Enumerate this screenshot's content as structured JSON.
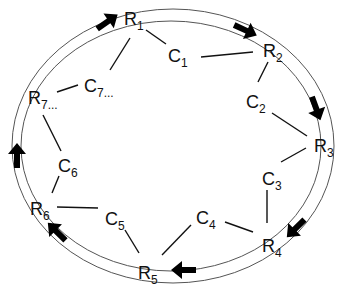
{
  "diagram": {
    "type": "ring",
    "ring": {
      "outer": {
        "cx": 173,
        "cy": 146,
        "rx": 161,
        "ry": 137
      },
      "inner": {
        "cx": 171,
        "cy": 146,
        "rx": 150,
        "ry": 125
      }
    },
    "colors": {
      "ring": "#555555",
      "link": "#111111",
      "arrow": "#000000",
      "text": "#111111"
    },
    "r_nodes": [
      {
        "id": "R1",
        "base": "R",
        "sub": "1",
        "suffix": "",
        "x": 124,
        "y": 25
      },
      {
        "id": "R2",
        "base": "R",
        "sub": "2",
        "suffix": "",
        "x": 263,
        "y": 57
      },
      {
        "id": "R3",
        "base": "R",
        "sub": "3",
        "suffix": "",
        "x": 314,
        "y": 152
      },
      {
        "id": "R4",
        "base": "R",
        "sub": "4",
        "suffix": "",
        "x": 262,
        "y": 252
      },
      {
        "id": "R5",
        "base": "R",
        "sub": "5",
        "suffix": "",
        "x": 138,
        "y": 279
      },
      {
        "id": "R6",
        "base": "R",
        "sub": "6",
        "suffix": "",
        "x": 30,
        "y": 215
      },
      {
        "id": "R7",
        "base": "R",
        "sub": "7",
        "suffix": "...",
        "x": 28,
        "y": 104
      }
    ],
    "c_nodes": [
      {
        "id": "C1",
        "base": "C",
        "sub": "1",
        "suffix": "",
        "x": 168,
        "y": 62
      },
      {
        "id": "C2",
        "base": "C",
        "sub": "2",
        "suffix": "",
        "x": 246,
        "y": 108
      },
      {
        "id": "C3",
        "base": "C",
        "sub": "3",
        "suffix": "",
        "x": 262,
        "y": 185
      },
      {
        "id": "C4",
        "base": "C",
        "sub": "4",
        "suffix": "",
        "x": 196,
        "y": 224
      },
      {
        "id": "C5",
        "base": "C",
        "sub": "5",
        "suffix": "",
        "x": 105,
        "y": 225
      },
      {
        "id": "C6",
        "base": "C",
        "sub": "6",
        "suffix": "",
        "x": 58,
        "y": 172
      },
      {
        "id": "C7",
        "base": "C",
        "sub": "7",
        "suffix": "...",
        "x": 84,
        "y": 92
      }
    ],
    "links": [
      {
        "from": "R1",
        "to": "C1",
        "x1": 146,
        "y1": 30,
        "x2": 166,
        "y2": 44
      },
      {
        "from": "C1",
        "to": "R2",
        "x1": 201,
        "y1": 57,
        "x2": 253,
        "y2": 52
      },
      {
        "from": "R2",
        "to": "C2",
        "x1": 268,
        "y1": 62,
        "x2": 258,
        "y2": 82
      },
      {
        "from": "C2",
        "to": "R3",
        "x1": 272,
        "y1": 113,
        "x2": 307,
        "y2": 136
      },
      {
        "from": "R3",
        "to": "C3",
        "x1": 306,
        "y1": 148,
        "x2": 281,
        "y2": 162
      },
      {
        "from": "C3",
        "to": "R4",
        "x1": 267,
        "y1": 190,
        "x2": 267,
        "y2": 223
      },
      {
        "from": "R4",
        "to": "C4",
        "x1": 253,
        "y1": 232,
        "x2": 225,
        "y2": 222
      },
      {
        "from": "C4",
        "to": "R5",
        "x1": 191,
        "y1": 225,
        "x2": 162,
        "y2": 255
      },
      {
        "from": "R5",
        "to": "C5",
        "x1": 139,
        "y1": 253,
        "x2": 125,
        "y2": 230
      },
      {
        "from": "C5",
        "to": "R6",
        "x1": 98,
        "y1": 208,
        "x2": 57,
        "y2": 207
      },
      {
        "from": "R6",
        "to": "C6",
        "x1": 52,
        "y1": 193,
        "x2": 59,
        "y2": 176
      },
      {
        "from": "C6",
        "to": "R7",
        "x1": 61,
        "y1": 151,
        "x2": 43,
        "y2": 115
      },
      {
        "from": "R7",
        "to": "C7",
        "x1": 57,
        "y1": 92,
        "x2": 78,
        "y2": 85
      },
      {
        "from": "C7",
        "to": "R1",
        "x1": 110,
        "y1": 70,
        "x2": 130,
        "y2": 38
      }
    ],
    "arrows": [
      {
        "name": "arrow-near-R1",
        "x": 107,
        "y": 22,
        "angle": -35
      },
      {
        "name": "arrow-near-R2",
        "x": 245,
        "y": 30,
        "angle": 25
      },
      {
        "name": "arrow-near-R3",
        "x": 316,
        "y": 108,
        "angle": 70
      },
      {
        "name": "arrow-near-R4",
        "x": 296,
        "y": 228,
        "angle": 135
      },
      {
        "name": "arrow-near-R5",
        "x": 184,
        "y": 270,
        "angle": 180
      },
      {
        "name": "arrow-near-R6",
        "x": 57,
        "y": 232,
        "angle": -135
      },
      {
        "name": "arrow-near-R7",
        "x": 17,
        "y": 156,
        "angle": -90
      }
    ]
  }
}
